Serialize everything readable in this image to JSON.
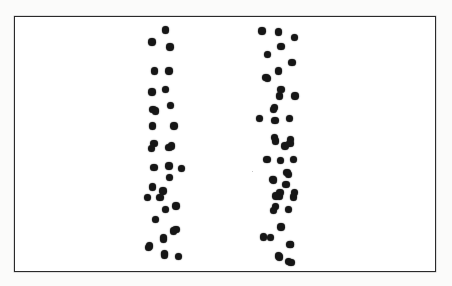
{
  "figure": {
    "type": "dot-pattern-illustration",
    "background_color": "#ffffff",
    "page_color": "#fbfbfa",
    "dot_color": "#161616",
    "frame": {
      "border_color": "#2a2a2a",
      "border_width_px": 1.6,
      "x": 14,
      "y": 16,
      "width": 422,
      "height": 256
    },
    "dot_diameter_px": 7.4,
    "columns": [
      {
        "name": "left-dot-column",
        "label": "Left column",
        "dot_count": 46,
        "x_center": 165,
        "x_spread": 34,
        "y_top": 27,
        "y_bottom": 258,
        "dots": [
          [
            166.0,
            30.5
          ],
          [
            152.7,
            42.5
          ],
          [
            170.5,
            47.5
          ],
          [
            155.0,
            71.5
          ],
          [
            169.5,
            71.5
          ],
          [
            152.7,
            92.5
          ],
          [
            166.0,
            90.0
          ],
          [
            153.7,
            110.0
          ],
          [
            171.3,
            106.0
          ],
          [
            156.0,
            111.5
          ],
          [
            153.0,
            126.7
          ],
          [
            174.7,
            126.7
          ],
          [
            154.7,
            144.3
          ],
          [
            172.3,
            146.7
          ],
          [
            152.3,
            149.0
          ],
          [
            169.7,
            148.3
          ],
          [
            154.7,
            168.3
          ],
          [
            169.7,
            166.7
          ],
          [
            182.3,
            169.0
          ],
          [
            170.3,
            178.3
          ],
          [
            153.0,
            187.7
          ],
          [
            163.7,
            191.7
          ],
          [
            148.3,
            198.3
          ],
          [
            160.7,
            198.3
          ],
          [
            176.7,
            206.7
          ],
          [
            166.0,
            210.0
          ],
          [
            156.0,
            220.0
          ],
          [
            176.7,
            230.0
          ],
          [
            174.3,
            231.7
          ],
          [
            164.0,
            238.3
          ],
          [
            164.3,
            240.0
          ],
          [
            150.0,
            246.7
          ],
          [
            149.0,
            248.3
          ],
          [
            165.0,
            254.0
          ],
          [
            165.0,
            255.7
          ],
          [
            179.0,
            257.3
          ]
        ]
      },
      {
        "name": "right-dot-column",
        "label": "Right column",
        "dot_count": 48,
        "x_center": 280,
        "x_spread": 36,
        "y_top": 28,
        "y_bottom": 264,
        "dots": [
          [
            262.7,
            31.7
          ],
          [
            279.3,
            32.7
          ],
          [
            295.0,
            38.3
          ],
          [
            281.7,
            47.3
          ],
          [
            268.3,
            55.0
          ],
          [
            292.7,
            63.3
          ],
          [
            279.3,
            71.7
          ],
          [
            266.7,
            78.3
          ],
          [
            268.3,
            79.0
          ],
          [
            280.0,
            96.7
          ],
          [
            295.7,
            96.7
          ],
          [
            281.7,
            90.0
          ],
          [
            274.3,
            110.0
          ],
          [
            275.0,
            108.3
          ],
          [
            260.0,
            119.0
          ],
          [
            275.7,
            121.0
          ],
          [
            290.0,
            119.0
          ],
          [
            275.0,
            138.3
          ],
          [
            291.0,
            140.0
          ],
          [
            276.0,
            141.7
          ],
          [
            285.7,
            146.7
          ],
          [
            290.7,
            144.0
          ],
          [
            267.7,
            160.0
          ],
          [
            281.0,
            161.0
          ],
          [
            294.3,
            160.0
          ],
          [
            287.7,
            173.3
          ],
          [
            289.3,
            175.0
          ],
          [
            273.3,
            180.0
          ],
          [
            274.0,
            180.7
          ],
          [
            286.7,
            185.0
          ],
          [
            280.0,
            196.7
          ],
          [
            280.7,
            193.3
          ],
          [
            294.3,
            197.7
          ],
          [
            295.0,
            193.3
          ],
          [
            276.0,
            207.3
          ],
          [
            276.7,
            196.7
          ],
          [
            274.0,
            211.0
          ],
          [
            289.3,
            210.0
          ],
          [
            281.7,
            227.7
          ],
          [
            264.0,
            237.7
          ],
          [
            271.0,
            238.3
          ],
          [
            290.7,
            245.0
          ],
          [
            291.0,
            245.0
          ],
          [
            279.3,
            256.7
          ],
          [
            280.0,
            257.7
          ],
          [
            289.3,
            262.3
          ],
          [
            291.7,
            263.3
          ]
        ]
      }
    ],
    "specks": [
      [
        253.0,
        172.0,
        1.6
      ]
    ]
  }
}
